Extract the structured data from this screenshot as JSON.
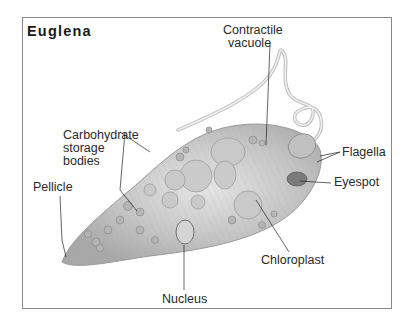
{
  "title": "Euglena",
  "labels": {
    "contractile_vacuole": [
      "Contractile",
      "vacuole"
    ],
    "carbohydrate": [
      "Carbohydrate",
      "storage",
      "bodies"
    ],
    "flagella": "Flagella",
    "eyespot": "Eyespot",
    "pellicle": "Pellicle",
    "chloroplast": "Chloroplast",
    "nucleus": "Nucleus"
  },
  "colors": {
    "body": "#b8b8b8",
    "outline": "#8a8a8a",
    "leader": "#222222"
  }
}
